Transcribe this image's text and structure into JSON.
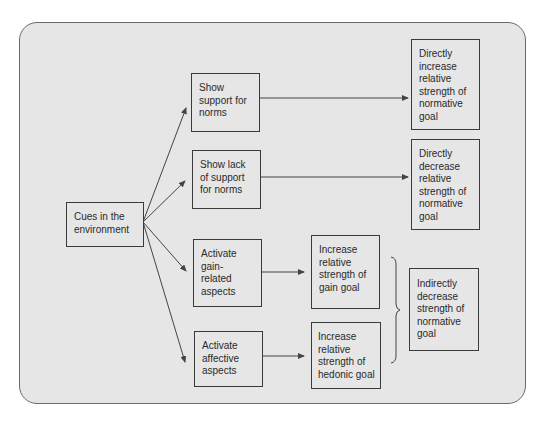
{
  "diagram": {
    "type": "flowchart",
    "colors": {
      "panel_bg": "#e6e6e6",
      "panel_border": "#6a6a6a",
      "node_border": "#3a3a3a",
      "text": "#2a2a2a",
      "line": "#444444"
    },
    "nodes": {
      "cues": {
        "label": "Cues in the\nenvironment"
      },
      "show_support": {
        "label": "Show\nsupport for\nnorms"
      },
      "show_lack": {
        "label": "Show lack\nof support\nfor norms"
      },
      "activate_gain": {
        "label": "Activate\ngain-\nrelated\naspects"
      },
      "activate_affective": {
        "label": "Activate\naffective\naspects"
      },
      "increase_gain": {
        "label": "Increase\nrelative\nstrength of\ngain goal"
      },
      "increase_hedonic": {
        "label": "Increase\nrelative\nstrength of\nhedonic goal"
      },
      "direct_increase": {
        "label": "Directly\nincrease\nrelative\nstrength of\nnormative\ngoal"
      },
      "direct_decrease": {
        "label": "Directly\ndecrease\nrelative\nstrength of\nnormative\ngoal"
      },
      "indirect_decrease": {
        "label": "Indirectly\ndecrease\nstrength of\nnormative\ngoal"
      }
    },
    "edges": [
      {
        "from": "cues",
        "to": "show_support"
      },
      {
        "from": "cues",
        "to": "show_lack"
      },
      {
        "from": "cues",
        "to": "activate_gain"
      },
      {
        "from": "cues",
        "to": "activate_affective"
      },
      {
        "from": "show_support",
        "to": "direct_increase"
      },
      {
        "from": "show_lack",
        "to": "direct_decrease"
      },
      {
        "from": "activate_gain",
        "to": "increase_gain"
      },
      {
        "from": "activate_affective",
        "to": "increase_hedonic"
      },
      {
        "from": [
          "increase_gain",
          "increase_hedonic"
        ],
        "to": "indirect_decrease",
        "connector": "brace"
      }
    ]
  }
}
